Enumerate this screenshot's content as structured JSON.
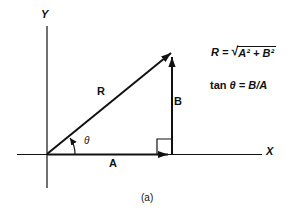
{
  "figure": {
    "caption": "(a)",
    "axes": {
      "x_label": "X",
      "y_label": "Y"
    },
    "vectors": {
      "resultant_label": "R",
      "horizontal_label": "A",
      "vertical_label": "B"
    },
    "angle_label": "θ",
    "equations": {
      "resultant_prefix": "R = ",
      "radical_sign": "√",
      "radicand": "A² + B²",
      "tangent_prefix": "tan ",
      "tangent_rest": "θ = B/A"
    },
    "colors": {
      "ink": "#111111",
      "background": "#ffffff"
    }
  }
}
